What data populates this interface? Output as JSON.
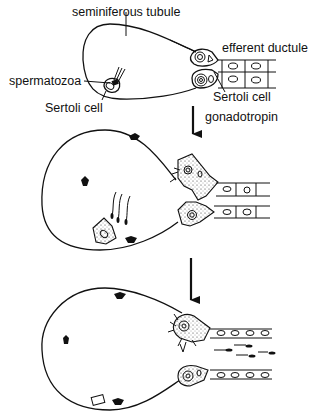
{
  "labels": {
    "tubule": "seminiferous tubule",
    "ductule": "efferent ductule",
    "spermatozoa": "spermatozoa",
    "sertoli_left": "Sertoli cell",
    "sertoli_right": "Sertoli cell",
    "stimulus": "gonadotropin"
  },
  "stages": [
    {
      "name": "stage-1-initial"
    },
    {
      "name": "stage-2-gonadotropin-response"
    },
    {
      "name": "stage-3-sperm-release"
    }
  ]
}
